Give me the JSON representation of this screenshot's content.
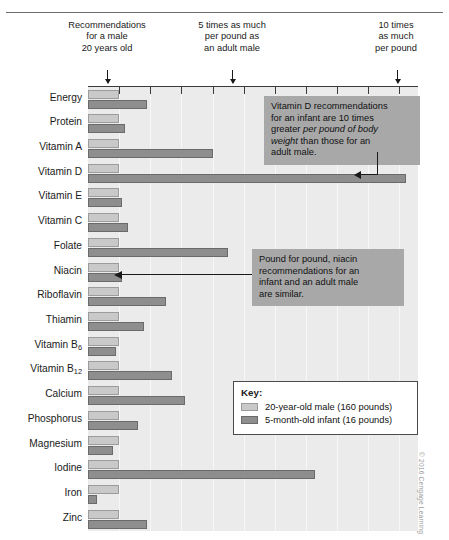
{
  "figure": {
    "credit": "© 2016 Cengage Learning"
  },
  "axis_notes": [
    {
      "text": "Recommendations\nfor a male\n20 years old",
      "value": 1
    },
    {
      "text": "5 times as much\nper pound as\nan adult male",
      "value": 5
    },
    {
      "text": "10 times\nas much\nper pound",
      "value": 10
    }
  ],
  "callouts": [
    {
      "id": "vitamin-d",
      "lines": [
        "Vitamin D recommendations",
        "for an infant are 10 times",
        "greater per pound of body",
        "weight than those for an",
        "adult male."
      ],
      "text": "Vitamin D recommendations for an infant are 10 times greater per pound of body weight than those for an adult male.",
      "emphasis": "per pound of body weight"
    },
    {
      "id": "niacin",
      "lines": [
        "Pound for pound, niacin",
        "recommendations for an",
        "infant and an adult male",
        "are similar."
      ],
      "text": "Pound for pound, niacin recommendations for an infant and an adult male are similar."
    }
  ],
  "key": {
    "title": "Key:",
    "entries": [
      {
        "label": "20-year-old male (160 pounds)",
        "color": "#c9c9c9",
        "series": "adult_male"
      },
      {
        "label": "5-month-old infant (16 pounds)",
        "color": "#8e8e8e",
        "series": "infant"
      }
    ]
  },
  "chart_data": {
    "type": "bar",
    "orientation": "horizontal",
    "title": "",
    "subtitle": "",
    "xlabel": "Amount per pound of body weight (relative to a 20-year-old male)",
    "ylabel": "",
    "xlim": [
      0,
      10.6
    ],
    "xticks": [
      0,
      1,
      2,
      3,
      4,
      5,
      6,
      7,
      8,
      9,
      10
    ],
    "grid": true,
    "legend_position": "bottom-right",
    "categories": [
      "Energy",
      "Protein",
      "Vitamin A",
      "Vitamin D",
      "Vitamin E",
      "Vitamin C",
      "Folate",
      "Niacin",
      "Riboflavin",
      "Thiamin",
      "Vitamin B6",
      "Vitamin B12",
      "Calcium",
      "Phosphorus",
      "Magnesium",
      "Iodine",
      "Iron",
      "Zinc"
    ],
    "category_labels_html": [
      "Energy",
      "Protein",
      "Vitamin A",
      "Vitamin D",
      "Vitamin E",
      "Vitamin C",
      "Folate",
      "Niacin",
      "Riboflavin",
      "Thiamin",
      "Vitamin B<sub>6</sub>",
      "Vitamin B<sub>12</sub>",
      "Calcium",
      "Phosphorus",
      "Magnesium",
      "Iodine",
      "Iron",
      "Zinc"
    ],
    "series": [
      {
        "name": "20-year-old male (160 pounds)",
        "color": "#c9c9c9",
        "values": [
          1,
          1,
          1,
          1,
          1,
          1,
          1,
          1,
          1,
          1,
          1,
          1,
          1,
          1,
          1,
          1,
          1,
          1
        ]
      },
      {
        "name": "5-month-old infant (16 pounds)",
        "color": "#8e8e8e",
        "values": [
          1.9,
          1.2,
          4.0,
          10.2,
          1.1,
          1.3,
          4.5,
          1.1,
          2.5,
          1.8,
          0.9,
          2.7,
          3.1,
          1.6,
          0.8,
          7.3,
          0.3,
          1.9
        ]
      }
    ]
  }
}
